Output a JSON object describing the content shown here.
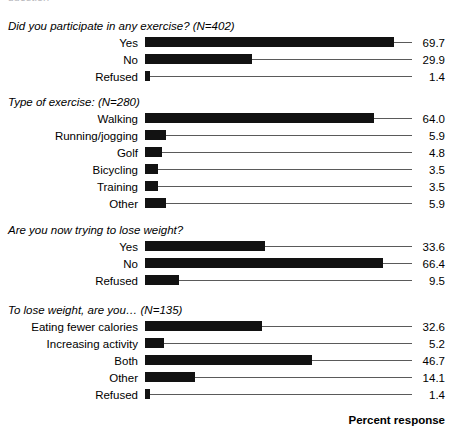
{
  "clipped_caption": "question",
  "axis_label": "Percent response",
  "value_axis_max": 71,
  "colors": {
    "bar": "#121212",
    "leader_line": "#5a5a5a",
    "text": "#000000",
    "background": "#ffffff"
  },
  "chart_data": {
    "type": "bar",
    "orientation": "horizontal",
    "title": "",
    "xlabel": "Percent response",
    "ylabel": "",
    "xlim": [
      0,
      71
    ],
    "grid": false,
    "legend": null,
    "panels": [
      {
        "title": "Did you participate in any exercise? (N=402)",
        "n": 402,
        "categories": [
          "Yes",
          "No",
          "Refused"
        ],
        "values": [
          69.7,
          29.9,
          1.4
        ]
      },
      {
        "title": "Type of exercise: (N=280)",
        "n": 280,
        "categories": [
          "Walking",
          "Running/jogging",
          "Golf",
          "Bicycling",
          "Training",
          "Other"
        ],
        "values": [
          64.0,
          5.9,
          4.8,
          3.5,
          3.5,
          5.9
        ]
      },
      {
        "title": "Are you now trying to lose weight?",
        "n": null,
        "categories": [
          "Yes",
          "No",
          "Refused"
        ],
        "values": [
          33.6,
          66.4,
          9.5
        ]
      },
      {
        "title": "To lose weight, are you… (N=135)",
        "n": 135,
        "categories": [
          "Eating fewer calories",
          "Increasing activity",
          "Both",
          "Other",
          "Refused"
        ],
        "values": [
          32.6,
          5.2,
          46.7,
          14.1,
          1.4
        ]
      }
    ]
  },
  "sections": [
    {
      "top": 20,
      "title": "Did you participate in any exercise? (N=402)",
      "rows": [
        {
          "label": "Yes",
          "value": "69.7"
        },
        {
          "label": "No",
          "value": "29.9"
        },
        {
          "label": "Refused",
          "value": "1.4"
        }
      ]
    },
    {
      "top": 96,
      "title": "Type of exercise: (N=280)",
      "rows": [
        {
          "label": "Walking",
          "value": "64.0"
        },
        {
          "label": "Running/jogging",
          "value": "5.9"
        },
        {
          "label": "Golf",
          "value": "4.8"
        },
        {
          "label": "Bicycling",
          "value": "3.5"
        },
        {
          "label": "Training",
          "value": "3.5"
        },
        {
          "label": "Other",
          "value": "5.9"
        }
      ]
    },
    {
      "top": 224,
      "title": "Are you now trying to lose weight?",
      "rows": [
        {
          "label": "Yes",
          "value": "33.6"
        },
        {
          "label": "No",
          "value": "66.4"
        },
        {
          "label": "Refused",
          "value": "9.5"
        }
      ]
    },
    {
      "top": 304,
      "title": "To lose weight, are you… (N=135)",
      "rows": [
        {
          "label": "Eating fewer calories",
          "value": "32.6"
        },
        {
          "label": "Increasing activity",
          "value": "5.2"
        },
        {
          "label": "Both",
          "value": "46.7"
        },
        {
          "label": "Other",
          "value": "14.1"
        },
        {
          "label": "Refused",
          "value": "1.4"
        }
      ]
    }
  ]
}
